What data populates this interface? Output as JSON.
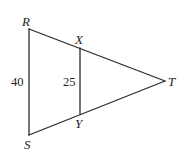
{
  "diagram": {
    "type": "geometry-triangle",
    "stroke_color": "#2b2b2b",
    "vertices": {
      "R": {
        "label": "R",
        "x": 29,
        "y": 29
      },
      "S": {
        "label": "S",
        "x": 29,
        "y": 135
      },
      "T": {
        "label": "T",
        "x": 165,
        "y": 81
      },
      "X": {
        "label": "X",
        "x": 80,
        "y": 48
      },
      "Y": {
        "label": "Y",
        "x": 80,
        "y": 114
      }
    },
    "segments": [
      {
        "name": "RS",
        "from": "R",
        "to": "S"
      },
      {
        "name": "RT",
        "from": "R",
        "to": "T"
      },
      {
        "name": "ST",
        "from": "S",
        "to": "T"
      },
      {
        "name": "XY",
        "from": "X",
        "to": "Y"
      }
    ],
    "measures": {
      "RS": "40",
      "XY": "25"
    }
  }
}
